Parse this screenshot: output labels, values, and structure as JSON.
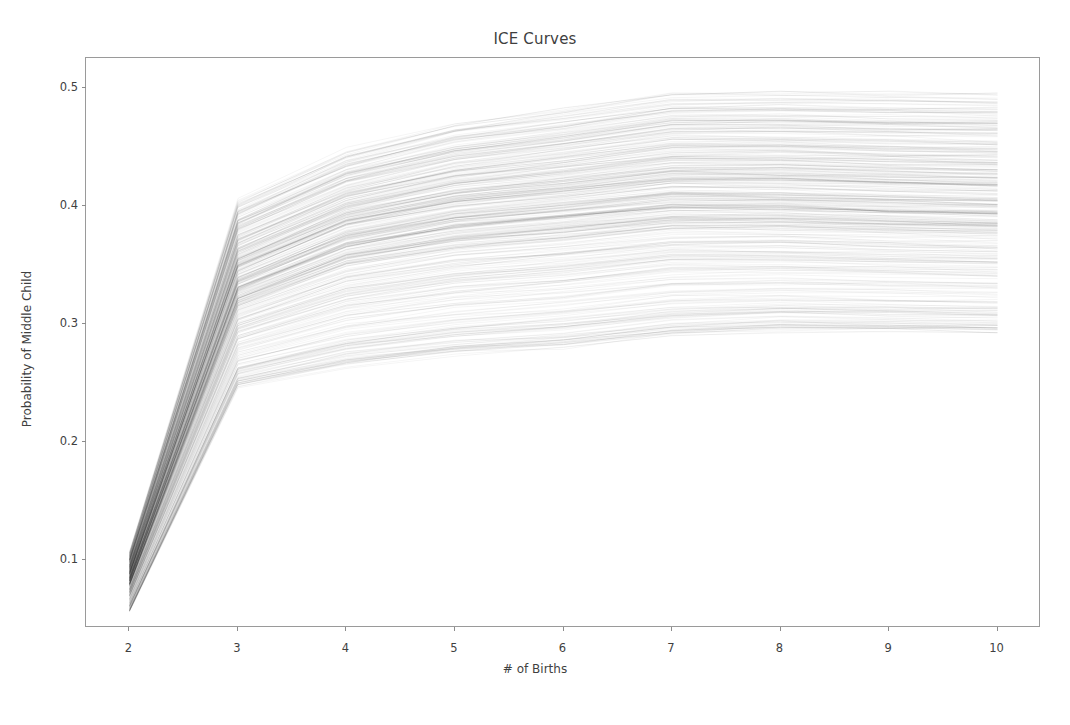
{
  "chart_data": {
    "type": "line",
    "title": "ICE Curves",
    "xlabel": "# of Births",
    "ylabel": "Probability of Middle Child",
    "x": [
      2,
      3,
      4,
      5,
      6,
      7,
      8,
      9,
      10
    ],
    "xlim": [
      1.6,
      10.4
    ],
    "ylim": [
      0.042,
      0.525
    ],
    "xticks": [
      2,
      3,
      4,
      5,
      6,
      7,
      8,
      9,
      10
    ],
    "xtick_labels": [
      "2",
      "3",
      "4",
      "5",
      "6",
      "7",
      "8",
      "9",
      "10"
    ],
    "yticks": [
      0.1,
      0.2,
      0.3,
      0.4,
      0.5
    ],
    "ytick_labels": [
      "0.1",
      "0.2",
      "0.3",
      "0.4",
      "0.5"
    ],
    "grid": false,
    "legend": null,
    "legend_position": "none",
    "line_color": "#000000",
    "line_alpha": 0.06,
    "line_width": 0.7,
    "n_curves": 420,
    "envelope": {
      "min": [
        0.055,
        0.245,
        0.262,
        0.272,
        0.278,
        0.288,
        0.292,
        0.291,
        0.29
      ],
      "median": [
        0.082,
        0.33,
        0.367,
        0.383,
        0.391,
        0.4,
        0.399,
        0.396,
        0.394
      ],
      "max": [
        0.106,
        0.405,
        0.447,
        0.47,
        0.482,
        0.496,
        0.497,
        0.496,
        0.495
      ]
    },
    "series": [
      {
        "name": "curve-lower-bound",
        "values": [
          0.055,
          0.245,
          0.262,
          0.272,
          0.278,
          0.288,
          0.292,
          0.291,
          0.29
        ]
      },
      {
        "name": "curve-q1",
        "values": [
          0.07,
          0.296,
          0.33,
          0.345,
          0.352,
          0.361,
          0.36,
          0.357,
          0.355
        ]
      },
      {
        "name": "curve-median",
        "values": [
          0.082,
          0.33,
          0.367,
          0.383,
          0.391,
          0.4,
          0.399,
          0.396,
          0.394
        ]
      },
      {
        "name": "curve-q3",
        "values": [
          0.093,
          0.362,
          0.4,
          0.417,
          0.426,
          0.436,
          0.435,
          0.432,
          0.43
        ]
      },
      {
        "name": "curve-upper-bound",
        "values": [
          0.106,
          0.405,
          0.447,
          0.47,
          0.482,
          0.496,
          0.497,
          0.496,
          0.495
        ]
      }
    ]
  }
}
